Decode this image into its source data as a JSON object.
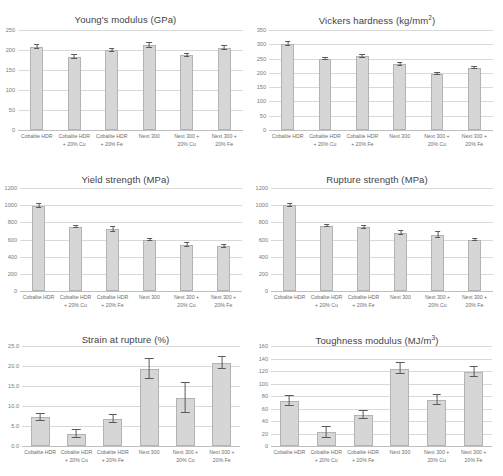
{
  "figure": {
    "categories": [
      "Cobalite HDR",
      "Cobalite HDR\n+ 20% Cu",
      "Cobalite HDR\n+ 20% Fe",
      "Next 300",
      "Next 300 +\n20% Cu",
      "Next 300 +\n20% Fe"
    ],
    "bar_color": "#d6d6d6",
    "bar_border_color": "#b3b3b3",
    "gridline_color": "#d9d9d9",
    "caption": ""
  },
  "chart_data": [
    {
      "type": "bar",
      "title": "Young's modulus (GPa)",
      "title_main": "Young's modulus (GPa)",
      "unit_sup": "",
      "categories": [
        "Cobalite HDR",
        "Cobalite HDR\n+ 20% Cu",
        "Cobalite HDR\n+ 20% Fe",
        "Next 300",
        "Next 300 +\n20% Cu",
        "Next 300 +\n20% Fe"
      ],
      "values": [
        208,
        183,
        200,
        212,
        187,
        205
      ],
      "errors": [
        5,
        4,
        4,
        6,
        4,
        5
      ],
      "ticks": [
        0,
        50,
        100,
        150,
        200,
        250
      ],
      "tick_labels": [
        "0",
        "50",
        "100",
        "150",
        "200",
        "250"
      ],
      "ylim": [
        0,
        250
      ],
      "xlabel": "",
      "ylabel": "",
      "grid": true,
      "legend": "none"
    },
    {
      "type": "bar",
      "title": "Vickers hardness (kg/mm2)",
      "title_main": "Vickers hardness (kg/mm",
      "unit_sup": "2",
      "categories": [
        "Cobalite HDR",
        "Cobalite HDR\n+ 20% Cu",
        "Cobalite HDR\n+ 20% Fe",
        "Next 300",
        "Next 300 +\n20% Cu",
        "Next 300 +\n20% Fe"
      ],
      "values": [
        302,
        249,
        258,
        230,
        197,
        218
      ],
      "errors": [
        8,
        4,
        6,
        5,
        5,
        4
      ],
      "ticks": [
        0,
        50,
        100,
        150,
        200,
        250,
        300,
        350
      ],
      "tick_labels": [
        "0",
        "50",
        "100",
        "150",
        "200",
        "250",
        "300",
        "350"
      ],
      "ylim": [
        0,
        350
      ],
      "xlabel": "",
      "ylabel": "",
      "grid": true,
      "legend": "none"
    },
    {
      "type": "bar",
      "title": "Yield strength (MPa)",
      "title_main": "Yield strength (MPa)",
      "unit_sup": "",
      "categories": [
        "Cobalite HDR",
        "Cobalite HDR\n+ 20% Cu",
        "Cobalite HDR\n+ 20% Fe",
        "Next 300",
        "Next 300 +\n20% Cu",
        "Next 300 +\n20% Fe"
      ],
      "values": [
        990,
        750,
        720,
        600,
        540,
        520
      ],
      "errors": [
        25,
        15,
        25,
        12,
        25,
        18
      ],
      "ticks": [
        0,
        200,
        400,
        600,
        800,
        1000,
        1200
      ],
      "tick_labels": [
        "0",
        "200",
        "400",
        "600",
        "800",
        "1000",
        "1200"
      ],
      "ylim": [
        0,
        1200
      ],
      "xlabel": "",
      "ylabel": "",
      "grid": true,
      "legend": "none"
    },
    {
      "type": "bar",
      "title": "Rupture strength (MPa)",
      "title_main": "Rupture strength (MPa)",
      "unit_sup": "",
      "categories": [
        "Cobalite HDR",
        "Cobalite HDR\n+ 20% Cu",
        "Cobalite HDR\n+ 20% Fe",
        "Next 300",
        "Next 300 +\n20% Cu",
        "Next 300 +\n20% Fe"
      ],
      "values": [
        1000,
        755,
        745,
        675,
        655,
        600
      ],
      "errors": [
        15,
        12,
        18,
        22,
        35,
        10
      ],
      "ticks": [
        0,
        200,
        400,
        600,
        800,
        1000,
        1200
      ],
      "tick_labels": [
        "0",
        "200",
        "400",
        "600",
        "800",
        "1000",
        "1200"
      ],
      "ylim": [
        0,
        1200
      ],
      "xlabel": "",
      "ylabel": "",
      "grid": true,
      "legend": "none"
    },
    {
      "type": "bar",
      "title": "Strain at rupture (%)",
      "title_main": "Strain at rupture (%)",
      "unit_sup": "",
      "categories": [
        "Cobalite HDR",
        "Cobalite HDR\n+ 20% Cu",
        "Cobalite HDR\n+ 20% Fe",
        "Next 300",
        "Next 300 +\n20% Cu",
        "Next 300 +\n20% Fe"
      ],
      "values": [
        7.2,
        3.0,
        6.8,
        19.3,
        12.0,
        20.8
      ],
      "errors": [
        0.8,
        1.0,
        0.9,
        2.6,
        3.8,
        1.6
      ],
      "ticks": [
        0,
        5,
        10,
        15,
        20,
        25
      ],
      "tick_labels": [
        "0.0",
        "5.0",
        "10.0",
        "15.0",
        "20.0",
        "25.0"
      ],
      "ylim": [
        0,
        25
      ],
      "xlabel": "",
      "ylabel": "",
      "grid": true,
      "legend": "none"
    },
    {
      "type": "bar",
      "title": "Toughness modulus (MJ/m3)",
      "title_main": "Toughness modulus (MJ/m",
      "unit_sup": "3",
      "categories": [
        "Cobalite HDR",
        "Cobalite HDR\n+ 20% Cu",
        "Cobalite HDR\n+ 20% Fe",
        "Next 300",
        "Next 300 +\n20% Cu",
        "Next 300 +\n20% Fe"
      ],
      "values": [
        72,
        22,
        50,
        124,
        74,
        118
      ],
      "errors": [
        8,
        9,
        6,
        9,
        8,
        8
      ],
      "ticks": [
        0,
        20,
        40,
        60,
        80,
        100,
        120,
        140,
        160
      ],
      "tick_labels": [
        "0",
        "20",
        "40",
        "60",
        "80",
        "100",
        "120",
        "140",
        "160"
      ],
      "ylim": [
        0,
        160
      ],
      "xlabel": "",
      "ylabel": "",
      "grid": true,
      "legend": "none"
    }
  ]
}
